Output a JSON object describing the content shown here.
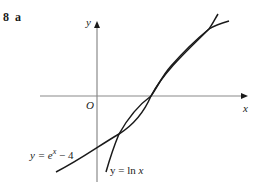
{
  "question": {
    "number": "8",
    "part": "a"
  },
  "axes": {
    "x_label": "x",
    "y_label": "y",
    "origin_label": "O"
  },
  "curves": [
    {
      "id": "exp",
      "label_lhs": "y = e",
      "label_sup": "x",
      "label_rhs": " − 4"
    },
    {
      "id": "ln",
      "label_lhs": "y = ln ",
      "label_var": "x"
    }
  ],
  "colors": {
    "axis": "#8a8a8a",
    "curve": "#1a1a1a",
    "text": "#1a1a1a"
  }
}
